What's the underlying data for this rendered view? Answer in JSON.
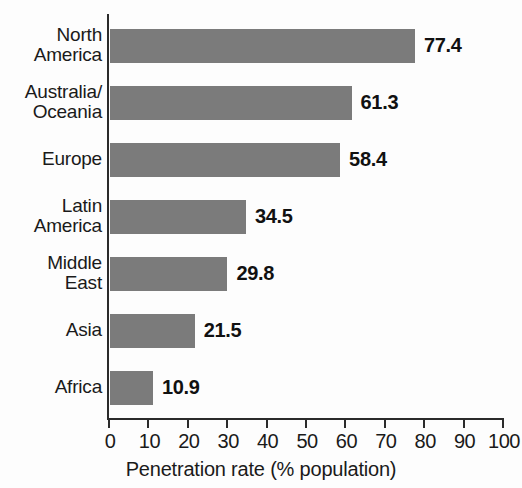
{
  "chart_data": {
    "type": "bar",
    "orientation": "horizontal",
    "title": "",
    "subtitle": "",
    "categories": [
      "North\nAmerica",
      "Australia/\nOceania",
      "Europe",
      "Latin\nAmerica",
      "Middle\nEast",
      "Asia",
      "Africa"
    ],
    "values": [
      77.4,
      61.3,
      58.4,
      34.5,
      29.8,
      21.5,
      10.9
    ],
    "value_labels": [
      "77.4",
      "61.3",
      "58.4",
      "34.5",
      "29.8",
      "21.5",
      "10.9"
    ],
    "xlabel": "Penetration rate (% population)",
    "ylabel": "",
    "xlim": [
      0,
      100
    ],
    "xticks": [
      0,
      10,
      20,
      30,
      40,
      50,
      60,
      70,
      80,
      90,
      100
    ],
    "xtick_labels": [
      "0",
      "10",
      "20",
      "30",
      "40",
      "50",
      "60",
      "70",
      "80",
      "90",
      "100"
    ],
    "grid": false,
    "legend": false,
    "bar_color": "#7b7b7b",
    "axis_color": "#2b2b2b",
    "text_color": "#1a1a1a",
    "background_color": "#fdfdfd"
  }
}
